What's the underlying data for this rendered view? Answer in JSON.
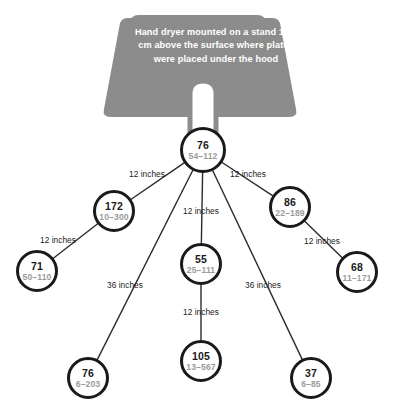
{
  "figure": {
    "callout": {
      "text": "Hand dryer mounted on a stand 15.2 cm above the surface where plates were placed under the hood",
      "box_color": "#8c8c8c",
      "text_color": "#ffffff"
    },
    "colors": {
      "node_stroke": "#1a1a1a",
      "node_fill": "#ffffff",
      "value_text": "#1a1a1a",
      "range_text": "#9b9b9b",
      "edge_stroke": "#2b2b2b",
      "background": "#ffffff"
    },
    "nodes": [
      {
        "id": "root",
        "value": "76",
        "range": "54–112",
        "cx": 203,
        "cy": 150,
        "r": 21.5
      },
      {
        "id": "left-1",
        "value": "172",
        "range": "10–300",
        "cx": 114,
        "cy": 211,
        "r": 19.5
      },
      {
        "id": "right-1",
        "value": "86",
        "range": "22–189",
        "cx": 290,
        "cy": 207,
        "r": 19.5
      },
      {
        "id": "left-2",
        "value": "71",
        "range": "50–110",
        "cx": 37,
        "cy": 271,
        "r": 19.5
      },
      {
        "id": "center-1",
        "value": "55",
        "range": "25–111",
        "cx": 201,
        "cy": 264,
        "r": 19.5
      },
      {
        "id": "right-2",
        "value": "68",
        "range": "11–171",
        "cx": 357,
        "cy": 272,
        "r": 19.5
      },
      {
        "id": "bottom-left",
        "value": "76",
        "range": "6–203",
        "cx": 88,
        "cy": 378,
        "r": 19.5
      },
      {
        "id": "bottom-mid",
        "value": "105",
        "range": "13–567",
        "cx": 201,
        "cy": 361,
        "r": 19.5
      },
      {
        "id": "bottom-right",
        "value": "37",
        "range": "6–85",
        "cx": 311,
        "cy": 378,
        "r": 19.5
      }
    ],
    "edges": [
      {
        "id": "root-left-1",
        "from": "root",
        "to": "left-1",
        "label": "12 inches",
        "lx": 147,
        "ly": 174
      },
      {
        "id": "root-right-1",
        "from": "root",
        "to": "right-1",
        "label": "12 inches",
        "lx": 248,
        "ly": 174
      },
      {
        "id": "root-center-1",
        "from": "root",
        "to": "center-1",
        "label": "12 inches",
        "lx": 201,
        "ly": 211
      },
      {
        "id": "left-1-left-2",
        "from": "left-1",
        "to": "left-2",
        "label": "12 inches",
        "lx": 58,
        "ly": 240
      },
      {
        "id": "right-1-right-2",
        "from": "right-1",
        "to": "right-2",
        "label": "12 inches",
        "lx": 322,
        "ly": 241
      },
      {
        "id": "root-bottom-left",
        "from": "root",
        "to": "bottom-left",
        "label": "36 inches",
        "lx": 125,
        "ly": 285
      },
      {
        "id": "root-bottom-right",
        "from": "root",
        "to": "bottom-right",
        "label": "36 inches",
        "lx": 263,
        "ly": 285
      },
      {
        "id": "center-1-bottom-mid",
        "from": "center-1",
        "to": "bottom-mid",
        "label": "12 inches",
        "lx": 201,
        "ly": 312
      }
    ]
  }
}
